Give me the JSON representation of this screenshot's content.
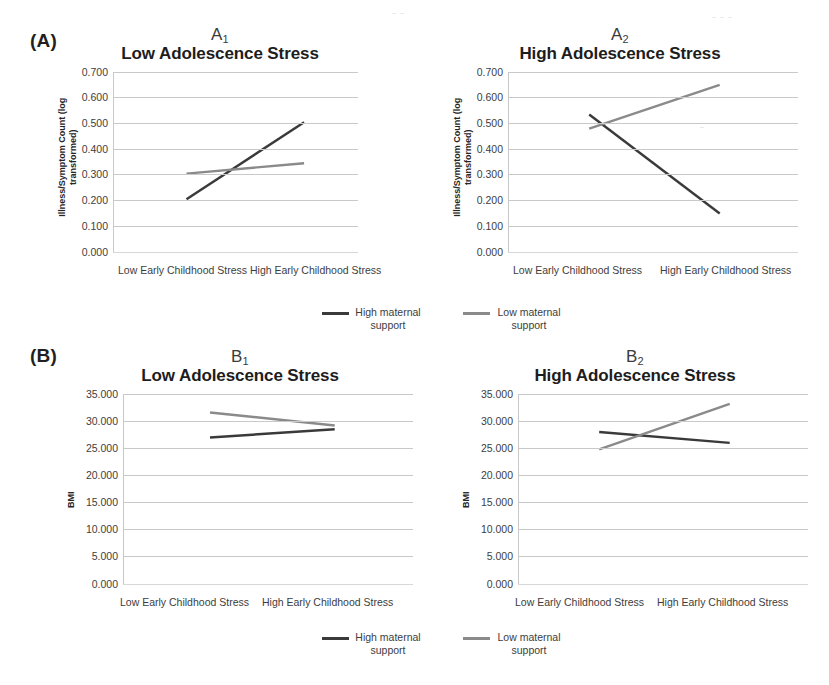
{
  "figure": {
    "panelA_label": "(A)",
    "panelB_label": "(B)",
    "legend": [
      {
        "label_line1": "High maternal",
        "label_line2": "support",
        "color": "#3a3a3a",
        "series": "high-maternal-support"
      },
      {
        "label_line1": "Low maternal",
        "label_line2": "support",
        "color": "#8a8a8a",
        "series": "low-maternal-support"
      }
    ]
  },
  "chart_data": [
    {
      "id": "A1",
      "type": "line",
      "panel_tag": "A",
      "panel_sub": "1",
      "title": "Low Adolescence Stress",
      "ylabel_line1": "Illness/Symptom Count (log",
      "ylabel_line2": "transformed)",
      "xlabel": "",
      "categories": [
        "Low Early Childhood Stress",
        "High Early Childhood Stress"
      ],
      "yticks": [
        "0.000",
        "0.100",
        "0.200",
        "0.300",
        "0.400",
        "0.500",
        "0.600",
        "0.700"
      ],
      "ylim": [
        0.0,
        0.7
      ],
      "grid": true,
      "legend_position": "below-figure",
      "series": [
        {
          "name": "High maternal support",
          "color": "#3a3a3a",
          "values": [
            0.205,
            0.505
          ]
        },
        {
          "name": "Low maternal support",
          "color": "#8a8a8a",
          "values": [
            0.305,
            0.345
          ]
        }
      ]
    },
    {
      "id": "A2",
      "type": "line",
      "panel_tag": "A",
      "panel_sub": "2",
      "title": "High Adolescence Stress",
      "ylabel_line1": "Illness/Symptom Count (log",
      "ylabel_line2": "transformed)",
      "xlabel": "",
      "categories": [
        "Low Early Childhood Stress",
        "High Early Childhood Stress"
      ],
      "yticks": [
        "0.000",
        "0.100",
        "0.200",
        "0.300",
        "0.400",
        "0.500",
        "0.600",
        "0.700"
      ],
      "ylim": [
        0.0,
        0.7
      ],
      "grid": true,
      "legend_position": "below-figure",
      "series": [
        {
          "name": "High maternal support",
          "color": "#3a3a3a",
          "values": [
            0.535,
            0.15
          ]
        },
        {
          "name": "Low maternal support",
          "color": "#8a8a8a",
          "values": [
            0.48,
            0.65
          ]
        }
      ]
    },
    {
      "id": "B1",
      "type": "line",
      "panel_tag": "B",
      "panel_sub": "1",
      "title": "Low Adolescence Stress",
      "ylabel_line1": "BMI",
      "ylabel_line2": "",
      "xlabel": "",
      "categories": [
        "Low Early Childhood Stress",
        "High Early Childhood Stress"
      ],
      "yticks": [
        "0.000",
        "5.000",
        "10.000",
        "15.000",
        "20.000",
        "25.000",
        "30.000",
        "35.000"
      ],
      "ylim": [
        0.0,
        35.0
      ],
      "grid": true,
      "legend_position": "below-figure",
      "series": [
        {
          "name": "High maternal support",
          "color": "#3a3a3a",
          "values": [
            27.0,
            28.5
          ]
        },
        {
          "name": "Low maternal support",
          "color": "#8a8a8a",
          "values": [
            31.6,
            29.2
          ]
        }
      ]
    },
    {
      "id": "B2",
      "type": "line",
      "panel_tag": "B",
      "panel_sub": "2",
      "title": "High Adolescence Stress",
      "ylabel_line1": "BMI",
      "ylabel_line2": "",
      "xlabel": "",
      "categories": [
        "Low Early Childhood Stress",
        "High Early Childhood Stress"
      ],
      "yticks": [
        "0.000",
        "5.000",
        "10.000",
        "15.000",
        "20.000",
        "25.000",
        "30.000",
        "35.000"
      ],
      "ylim": [
        0.0,
        35.0
      ],
      "grid": true,
      "legend_position": "below-figure",
      "series": [
        {
          "name": "High maternal support",
          "color": "#3a3a3a",
          "values": [
            28.0,
            26.0
          ]
        },
        {
          "name": "Low maternal support",
          "color": "#8a8a8a",
          "values": [
            24.8,
            33.2
          ]
        }
      ]
    }
  ]
}
